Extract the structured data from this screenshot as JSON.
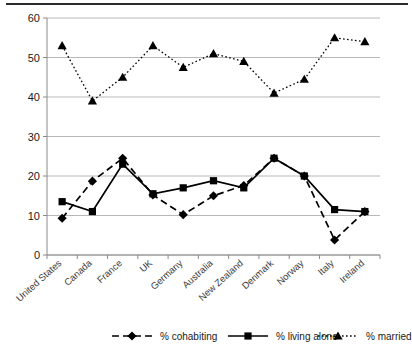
{
  "chart_data": {
    "type": "line",
    "title": "",
    "subtitle": "",
    "xlabel": "",
    "ylabel": "",
    "ylim": [
      0,
      60
    ],
    "ytick_step": 10,
    "yticks": [
      "0",
      "10",
      "20",
      "30",
      "40",
      "50",
      "60"
    ],
    "grid": true,
    "legend_position": "bottom",
    "categories": [
      "United States",
      "Canada",
      "France",
      "UK",
      "Germany",
      "Australia",
      "New Zealand",
      "Denmark",
      "Norway",
      "Italy",
      "Ireland"
    ],
    "series": [
      {
        "name": "% cohabiting",
        "marker": "diamond",
        "line_style": "dashed",
        "color": "#000000",
        "values": [
          9.3,
          18.7,
          24.5,
          15.2,
          10.2,
          15.0,
          17.6,
          24.5,
          20.0,
          3.8,
          11.0
        ]
      },
      {
        "name": "% living alone",
        "marker": "square",
        "line_style": "solid",
        "color": "#000000",
        "values": [
          13.5,
          11.0,
          23.0,
          15.5,
          17.0,
          18.8,
          17.0,
          24.5,
          20.0,
          11.5,
          11.0
        ]
      },
      {
        "name": "% married",
        "marker": "triangle",
        "line_style": "dotted",
        "color": "#000000",
        "values": [
          53.0,
          39.0,
          45.0,
          53.0,
          47.5,
          51.0,
          49.0,
          41.0,
          44.5,
          55.0,
          54.0
        ]
      }
    ]
  },
  "legend": {
    "items": [
      {
        "label": "% cohabiting"
      },
      {
        "label": "% living alone"
      },
      {
        "label": "% married"
      }
    ]
  }
}
